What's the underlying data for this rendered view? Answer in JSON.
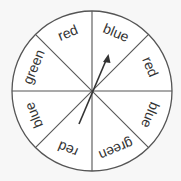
{
  "spinner": {
    "center": [
      92,
      91
    ],
    "radius": 80,
    "sections": [
      {
        "label": "blue",
        "angle": -67.5
      },
      {
        "label": "red",
        "angle": -22.5
      },
      {
        "label": "blue",
        "angle": 22.5
      },
      {
        "label": "green",
        "angle": 67.5
      },
      {
        "label": "red",
        "angle": 112.5
      },
      {
        "label": "blue",
        "angle": 157.5
      },
      {
        "label": "green",
        "angle": 202.5
      },
      {
        "label": "red",
        "angle": 247.5
      }
    ],
    "arrow": {
      "tail": [
        79,
        124
      ],
      "tip": [
        108,
        55
      ]
    },
    "colors": {
      "line": "#555555",
      "text": "#333333",
      "background": "#f7f7f7"
    }
  }
}
